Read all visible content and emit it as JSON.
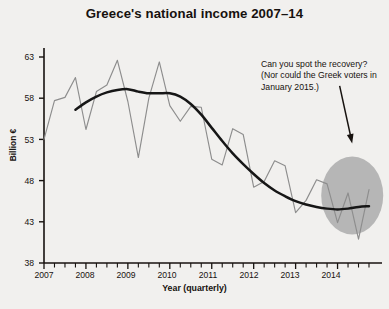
{
  "chart_data": {
    "type": "line",
    "title": "Greece's national income 2007–14",
    "xlabel": "Year (quarterly)",
    "ylabel": "Billion €",
    "ylim": [
      38,
      63
    ],
    "xlim": [
      2007.0,
      2014.75
    ],
    "yticks": [
      38,
      43,
      48,
      53,
      58,
      63
    ],
    "xticks": [
      2007,
      2008,
      2009,
      2010,
      2011,
      2012,
      2013,
      2014
    ],
    "grid": false,
    "legend": "none",
    "minor_ticks": "quarterly",
    "series": [
      {
        "name": "Quarterly national income (raw)",
        "style": "thin-grey-line",
        "color": "#8d8d8d",
        "x": [
          2007.0,
          2007.25,
          2007.5,
          2007.75,
          2008.0,
          2008.25,
          2008.5,
          2008.75,
          2009.0,
          2009.25,
          2009.5,
          2009.75,
          2010.0,
          2010.25,
          2010.5,
          2010.75,
          2011.0,
          2011.25,
          2011.5,
          2011.75,
          2012.0,
          2012.25,
          2012.5,
          2012.75,
          2013.0,
          2013.25,
          2013.5,
          2013.75,
          2014.0,
          2014.25,
          2014.5,
          2014.75
        ],
        "values": [
          53.0,
          57.7,
          58.1,
          60.5,
          54.2,
          58.8,
          59.6,
          62.6,
          57.6,
          50.8,
          58.0,
          62.4,
          57.1,
          55.2,
          57.0,
          56.9,
          50.6,
          49.9,
          54.3,
          53.6,
          47.2,
          47.9,
          50.4,
          49.8,
          44.1,
          45.6,
          48.1,
          47.6,
          42.9,
          46.5,
          40.9,
          46.9
        ]
      },
      {
        "name": "Smoothed trend",
        "style": "thick-black-line",
        "color": "#161616",
        "x": [
          2007.75,
          2008.0,
          2008.25,
          2008.5,
          2008.75,
          2009.0,
          2009.25,
          2009.5,
          2009.75,
          2010.0,
          2010.25,
          2010.5,
          2010.75,
          2011.0,
          2011.25,
          2011.5,
          2011.75,
          2012.0,
          2012.25,
          2012.5,
          2012.75,
          2013.0,
          2013.25,
          2013.5,
          2013.75,
          2014.0,
          2014.25,
          2014.5,
          2014.75
        ],
        "values": [
          56.6,
          57.5,
          58.2,
          58.7,
          59.0,
          59.1,
          58.8,
          58.6,
          58.6,
          58.6,
          58.2,
          57.3,
          56.0,
          54.4,
          52.8,
          51.3,
          50.0,
          48.8,
          47.7,
          46.8,
          46.1,
          45.5,
          45.1,
          44.8,
          44.6,
          44.5,
          44.6,
          44.8,
          44.9
        ]
      }
    ],
    "annotations": [
      {
        "text": "Can you spot the recovery? (Nor could the Greek voters in January 2015.)",
        "type": "callout-with-arrow",
        "arrow_from": [
          2014.05,
          59.5
        ],
        "arrow_to": [
          2014.35,
          52.5
        ]
      },
      {
        "type": "highlight-ellipse",
        "center_x": 2014.35,
        "center_y": 46.2,
        "color": "#b6b6b6"
      }
    ]
  },
  "chart": {
    "title": "Greece's national income 2007–14",
    "y_axis_label": "Billion €",
    "x_axis_label": "Year (quarterly)",
    "y_tick_labels": [
      "63",
      "58",
      "53",
      "48",
      "43",
      "38"
    ],
    "x_tick_labels": [
      "2007",
      "2008",
      "2009",
      "2010",
      "2011",
      "2012",
      "2013",
      "2014"
    ],
    "annotation_text": "Can you spot the recovery? (Nor could the Greek voters in January 2015.)"
  }
}
